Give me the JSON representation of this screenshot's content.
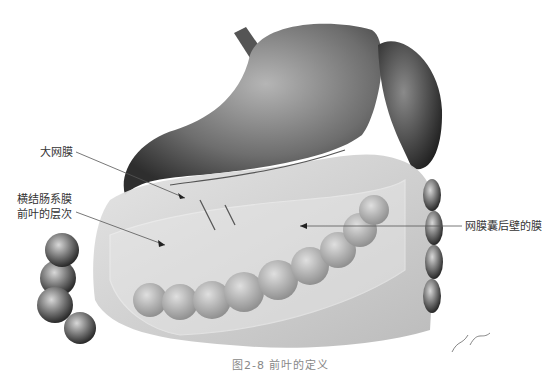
{
  "figure": {
    "caption": "图2-8  前叶的定义",
    "signature": "Nao ha",
    "labels": {
      "greater_omentum": "大网膜",
      "transverse_mesocolon_line1": "横结肠系膜",
      "transverse_mesocolon_line2": "前叶的层次",
      "omental_bursa_posterior": "网膜囊后壁的膜"
    },
    "colors": {
      "background": "#ffffff",
      "organ_dark": "#3a3a3a",
      "organ_mid": "#7a7a7a",
      "membrane": "#c8c8c8",
      "label_text": "#333333",
      "leader_line": "#555555"
    }
  }
}
